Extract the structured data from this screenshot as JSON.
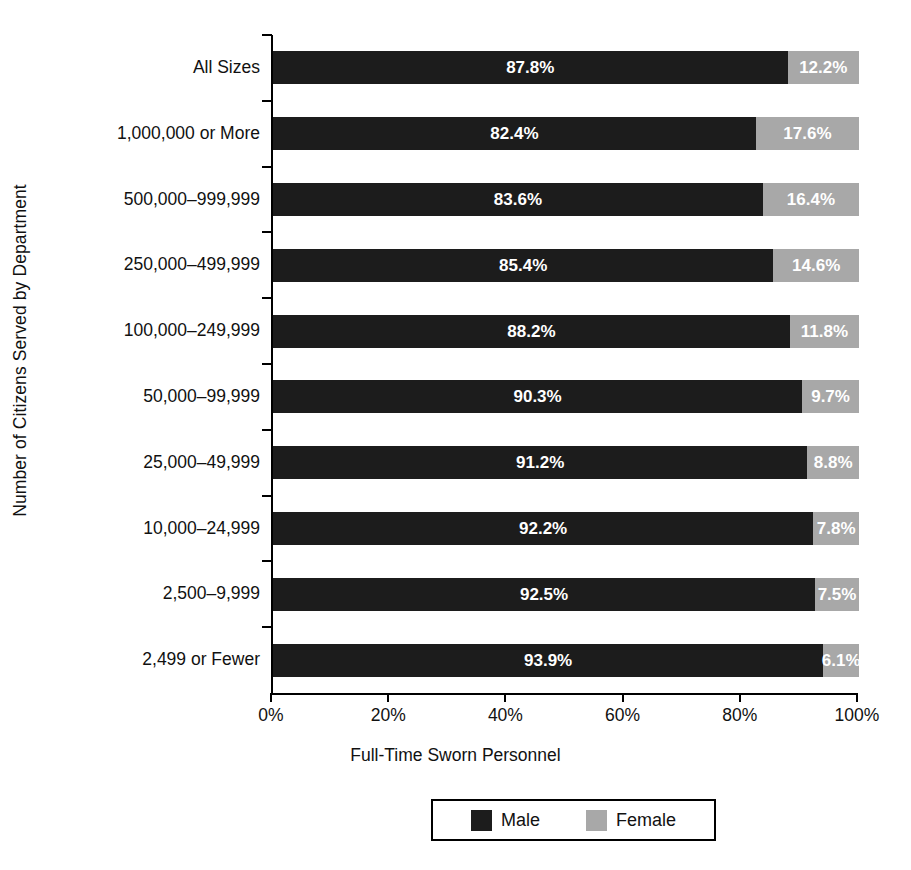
{
  "chart_data": {
    "type": "bar",
    "subtype": "horizontal-stacked-100pct",
    "title": "",
    "xlabel": "Full-Time Sworn Personnel",
    "ylabel": "Number of Citizens Served by Department",
    "xlim": [
      0,
      100
    ],
    "grid": false,
    "legend_position": "bottom",
    "xticks": [
      "0%",
      "20%",
      "40%",
      "60%",
      "80%",
      "100%"
    ],
    "xtick_values": [
      0,
      20,
      40,
      60,
      80,
      100
    ],
    "categories": [
      "All Sizes",
      "1,000,000 or More",
      "500,000–999,999",
      "250,000–499,999",
      "100,000–249,999",
      "50,000–99,999",
      "25,000–49,999",
      "10,000–24,999",
      "2,500–9,999",
      "2,499 or Fewer"
    ],
    "series": [
      {
        "name": "Male",
        "color": "#1c1c1c",
        "values": [
          87.8,
          82.4,
          83.6,
          85.4,
          88.2,
          90.3,
          91.2,
          92.2,
          92.5,
          93.9
        ],
        "labels": [
          "87.8%",
          "82.4%",
          "83.6%",
          "85.4%",
          "88.2%",
          "90.3%",
          "91.2%",
          "92.2%",
          "92.5%",
          "93.9%"
        ]
      },
      {
        "name": "Female",
        "color": "#a8a8a8",
        "values": [
          12.2,
          17.6,
          16.4,
          14.6,
          11.8,
          9.7,
          8.8,
          7.8,
          7.5,
          6.1
        ],
        "labels": [
          "12.2%",
          "17.6%",
          "16.4%",
          "14.6%",
          "11.8%",
          "9.7%",
          "8.8%",
          "7.8%",
          "7.5%",
          "6.1%"
        ]
      }
    ]
  },
  "legend": {
    "items": [
      {
        "label": "Male",
        "color": "#1c1c1c"
      },
      {
        "label": "Female",
        "color": "#a8a8a8"
      }
    ]
  },
  "axes": {
    "x_title": "Full-Time Sworn Personnel",
    "y_title": "Number of Citizens Served by Department"
  }
}
